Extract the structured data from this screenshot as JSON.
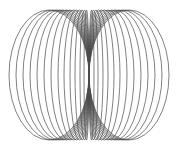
{
  "figure": {
    "stroke_color": "#4a4a4a",
    "background": "#ffffff",
    "center": {
      "x": 89,
      "y": 75
    },
    "vertical_semi_axis": 65,
    "left_loop_outer_edges": [
      9,
      16,
      23,
      30,
      37,
      44,
      51,
      58,
      64,
      70,
      75,
      80,
      84
    ],
    "right_loop_outer_edges": [
      169,
      162,
      155,
      148,
      141,
      134,
      127,
      120,
      114,
      108,
      103,
      98,
      94
    ]
  }
}
